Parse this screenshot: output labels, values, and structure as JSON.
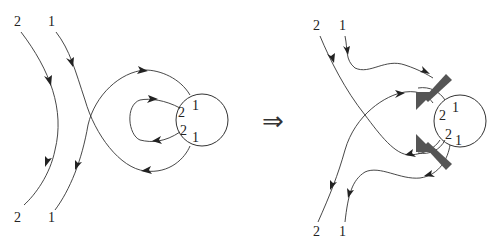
{
  "diagram": {
    "type": "topological strand diagram",
    "implication_symbol": "⇒",
    "left": {
      "top_labels": [
        "2",
        "1"
      ],
      "bottom_labels": [
        "2",
        "1"
      ],
      "circle_labels": {
        "upper_left": "2",
        "upper_right": "1",
        "lower_left": "2",
        "lower_right": "1"
      }
    },
    "right": {
      "top_labels": [
        "2",
        "1"
      ],
      "bottom_labels": [
        "2",
        "1"
      ],
      "circle_labels": {
        "upper_left": "2",
        "upper_right": "1",
        "lower_left": "2",
        "lower_right": "1"
      },
      "thick_arrows": [
        "upper-thick-arrow",
        "lower-thick-arrow"
      ]
    }
  }
}
